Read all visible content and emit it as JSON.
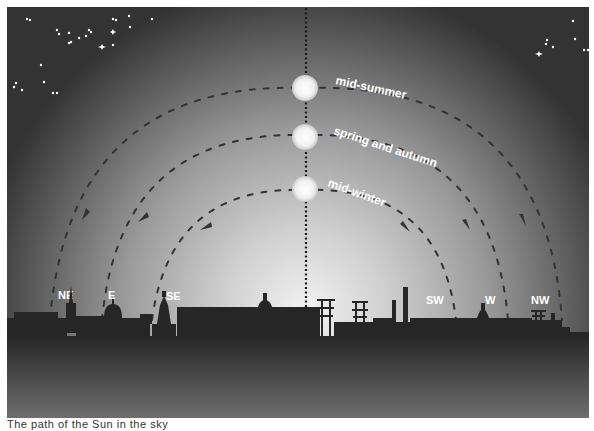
{
  "figure": {
    "labels": {
      "mid_summer": "mid-summer",
      "spring_autumn": "spring and autumn",
      "mid_winter": "mid-winter"
    },
    "compass": {
      "ne": "NE",
      "e": "E",
      "se": "SE",
      "sw": "SW",
      "w": "W",
      "nw": "NW"
    },
    "colors": {
      "sky_top": "#3b3b3b",
      "glow": "#e6e6e6",
      "ground": "#2a2a2a",
      "path": "#333333",
      "label": "#ffffff"
    }
  },
  "caption": "The path of the Sun in the sky"
}
